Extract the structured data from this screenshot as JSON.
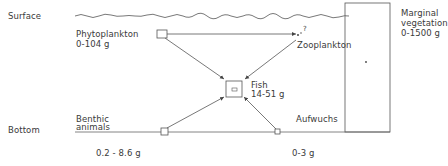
{
  "levels": {
    "surface": "Surface",
    "bottom": "Bottom"
  },
  "nodes": {
    "phytoplankton": {
      "name": "Phytoplankton",
      "biomass": "0-104 g"
    },
    "zooplankton": {
      "name": "Zooplankton",
      "uncertainty_mark": "?"
    },
    "fish": {
      "name": "Fish",
      "biomass": "14-51 g"
    },
    "benthic_animals": {
      "name_line1": "Benthic",
      "name_line2": "animals",
      "biomass": "0.2 - 8.6 g"
    },
    "aufwuchs": {
      "name": "Aufwuchs",
      "biomass": "0-3 g"
    },
    "marginal_vegetation": {
      "name_line1": "Marginal",
      "name_line2": "vegetation",
      "biomass": "0-1500 g"
    }
  },
  "colors": {
    "line": "#555555",
    "text": "#3a3a3a",
    "background": "#ffffff"
  }
}
